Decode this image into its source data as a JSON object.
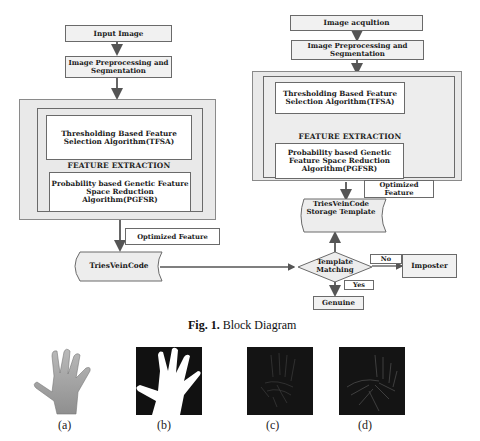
{
  "left_diagram": {
    "input_image": "Input Image",
    "preprocessing": "Image Preprocessing and Segmentation",
    "tfsa": "Thresholding Based Feature Selection Algorithm(TFSA)",
    "feature_extraction": "FEATURE EXTRACTION",
    "pgfsr": "Probability based Genetic Feature Space Reduction Algorithm(PGFSR)",
    "optimized_feature": "Optimized Feature",
    "tries_vein_code": "TriesVeinCode"
  },
  "right_diagram": {
    "image_acquisition": "Image acqultion",
    "preprocessing": "Image Preprocessing and Segmentation",
    "tfsa": "Thresholding Based Feature Selection Algorithm(TFSA)",
    "feature_extraction": "FEATURE EXTRACTION",
    "pgfsr": "Probability based Genetic Feature Space Reduction Algorithm(PGFSR)",
    "optimized_feature": "Optimized Feature",
    "storage_template": "TriesVeinCode Storage Template",
    "template_matching": "Template Matching",
    "no_label": "No",
    "yes_label": "Yes",
    "imposter": "Imposter",
    "genuine": "Genuine"
  },
  "figure_caption": {
    "prefix": "Fig. 1.",
    "title": "Block Diagram"
  },
  "sub_images": [
    {
      "label": "(a)",
      "description": "hand-photo"
    },
    {
      "label": "(b)",
      "description": "binary-hand-silhouette"
    },
    {
      "label": "(c)",
      "description": "vein-feature-map"
    },
    {
      "label": "(d)",
      "description": "enhanced-vein-map"
    }
  ],
  "colors": {
    "box_fill": "#f1f1f1",
    "outer_fill": "#e9e9e9",
    "border": "#6a6a6a",
    "line": "#555555",
    "image_bg": "#141414"
  }
}
